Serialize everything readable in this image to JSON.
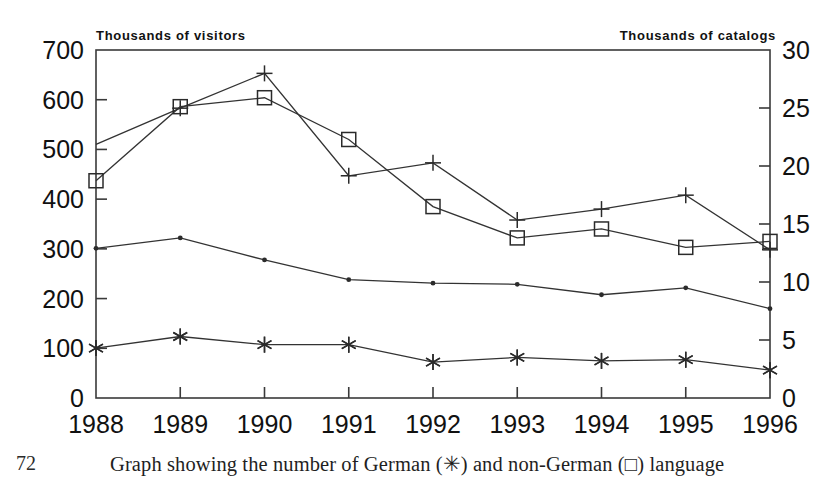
{
  "figure": {
    "page_number": "72",
    "caption": "Graph showing the number of German (✳) and non-German (□) language",
    "left_axis_title": "Thousands of visitors",
    "right_axis_title": "Thousands of catalogs"
  },
  "chart_data": {
    "type": "line",
    "title": "",
    "xlabel": "",
    "ylabel": "Thousands of visitors",
    "y2label": "Thousands of catalogs",
    "x": [
      "1988",
      "1989",
      "1990",
      "1991",
      "1992",
      "1993",
      "1994",
      "1995",
      "1996"
    ],
    "categories": [
      "1988",
      "1989",
      "1990",
      "1991",
      "1992",
      "1993",
      "1994",
      "1995",
      "1996"
    ],
    "ylim": [
      0,
      700
    ],
    "y2lim": [
      0,
      30
    ],
    "yticks": [
      0,
      100,
      200,
      300,
      400,
      500,
      600,
      700
    ],
    "y2ticks": [
      0,
      5,
      10,
      15,
      20,
      25,
      30
    ],
    "ytick_labels": [
      "0",
      "100",
      "200",
      "300",
      "400",
      "500",
      "600",
      "700"
    ],
    "y2tick_labels": [
      "0",
      "5",
      "10",
      "15",
      "20",
      "25",
      "30"
    ],
    "grid": false,
    "legend_position": "none",
    "series": [
      {
        "name": "visitors-plus",
        "marker": "plus",
        "axis": "left",
        "values": [
          510,
          583,
          653,
          447,
          473,
          358,
          380,
          408,
          298
        ]
      },
      {
        "name": "visitors-square",
        "marker": "square",
        "axis": "left",
        "values": [
          437,
          586,
          604,
          520,
          385,
          322,
          340,
          303,
          315
        ]
      },
      {
        "name": "catalogs-dot",
        "marker": "dot",
        "axis": "right",
        "values": [
          12.9,
          13.8,
          11.9,
          10.2,
          9.9,
          9.8,
          8.9,
          9.5,
          7.7
        ]
      },
      {
        "name": "catalogs-asterisk",
        "marker": "asterisk",
        "axis": "right",
        "values": [
          4.3,
          5.3,
          4.6,
          4.6,
          3.1,
          3.5,
          3.2,
          3.3,
          2.4
        ]
      }
    ],
    "annotations": []
  }
}
